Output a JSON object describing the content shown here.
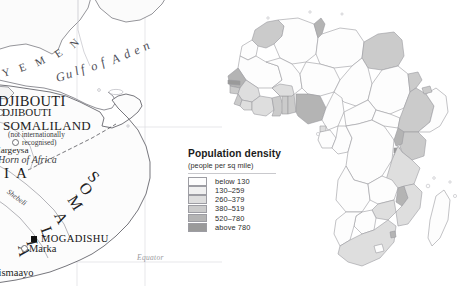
{
  "detail_map": {
    "name": "horn-of-africa-detail-map",
    "labels": {
      "yemen": "YEMEN",
      "gulf_of_aden": "Gulf of Aden",
      "djibouti_country": "DJIBOUTI",
      "djibouti_city": "DJIBOUTI",
      "somaliland": "SOMALILAND",
      "somaliland_note_line1": "(not internationally",
      "somaliland_note_line2": "recognised)",
      "hargeysa": "Hargeysa",
      "horn_of_africa": "Horn of Africa",
      "ethiopia_partial": "I A",
      "somalia": "SOMALIA",
      "shebeli": "Shebeli",
      "mogadishu": "MOGADISHU",
      "marka": "Marka",
      "kismaayo": "Kismaayo",
      "equator": "Equator"
    }
  },
  "continent_map": {
    "name": "africa-population-density-map"
  },
  "legend": {
    "title": "Population density",
    "subtitle": "(people per sq mile)",
    "classes": [
      {
        "label": "below 130",
        "color": "#fdfdfd"
      },
      {
        "label": "130–259",
        "color": "#f0f0f0"
      },
      {
        "label": "260–379",
        "color": "#dedede"
      },
      {
        "label": "380–519",
        "color": "#cbcbcb"
      },
      {
        "label": "520–780",
        "color": "#b4b4b4"
      },
      {
        "label": "above 780",
        "color": "#9a9a9a"
      }
    ]
  },
  "colors": {
    "background": "#ffffff",
    "border": "#8e8e94",
    "coastline": "#6f6f75",
    "graticule": "#d5d5da",
    "marker": "#111111"
  }
}
